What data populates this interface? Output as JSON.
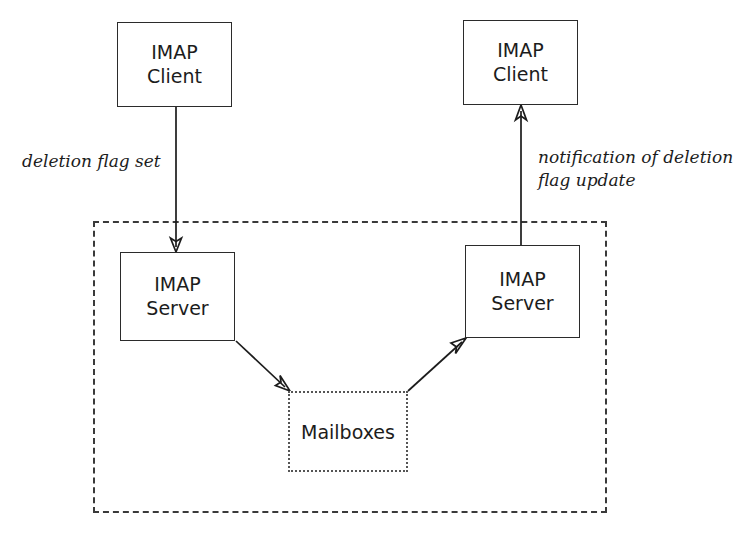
{
  "diagram": {
    "type": "flow-diagram",
    "nodes": [
      {
        "id": "client-left",
        "line1": "IMAP",
        "line2": "Client",
        "shape": "rectangle",
        "border": "solid"
      },
      {
        "id": "client-right",
        "line1": "IMAP",
        "line2": "Client",
        "shape": "rectangle",
        "border": "solid"
      },
      {
        "id": "server-left",
        "line1": "IMAP",
        "line2": "Server",
        "shape": "rectangle",
        "border": "solid"
      },
      {
        "id": "server-right",
        "line1": "IMAP",
        "line2": "Server",
        "shape": "rectangle",
        "border": "solid"
      },
      {
        "id": "mailboxes",
        "label": "Mailboxes",
        "shape": "rectangle",
        "border": "dotted"
      }
    ],
    "boundary": {
      "id": "server-domain",
      "border": "dashed",
      "label": ""
    },
    "edge_labels": {
      "left": "deletion flag set",
      "right_line1": "notification of deletion",
      "right_line2": "flag update"
    },
    "colors": {
      "stroke": "#1c1c1c",
      "boundary_stroke": "#3a3a3a",
      "store_stroke": "#555555",
      "background": "#ffffff",
      "text": "#1c1c1c"
    }
  }
}
